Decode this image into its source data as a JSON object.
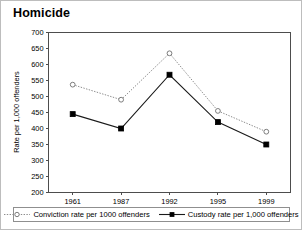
{
  "chart_data": {
    "type": "line",
    "title": "Homicide",
    "xlabel": "",
    "ylabel": "Rate per 1,000 offenders",
    "categories": [
      "1961",
      "1987",
      "1992",
      "1995",
      "1999"
    ],
    "ylim": [
      200,
      700
    ],
    "yticks": [
      200,
      250,
      300,
      350,
      400,
      450,
      500,
      550,
      600,
      650,
      700
    ],
    "grid": false,
    "legend_position": "bottom",
    "series": [
      {
        "name": "Conviction rate per 1000 offenders",
        "values": [
          537,
          490,
          635,
          455,
          390
        ],
        "marker": "open-circle",
        "line_style": "dotted",
        "color": "#8c8c8c"
      },
      {
        "name": "Custody rate per 1,000 offenders",
        "values": [
          445,
          400,
          568,
          420,
          350
        ],
        "marker": "filled-square",
        "line_style": "solid",
        "color": "#1a1a1a"
      }
    ]
  },
  "legend": {
    "items": [
      {
        "label": "Conviction rate per 1000 offenders"
      },
      {
        "label": "Custody rate per 1,000 offenders"
      }
    ]
  }
}
